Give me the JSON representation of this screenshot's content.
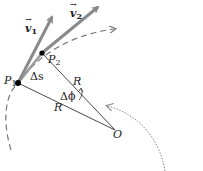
{
  "diagram": {
    "title": "",
    "labels": {
      "v1": "v",
      "v1_sub": "1",
      "v2": "v",
      "v2_sub": "2",
      "p1": "P",
      "p1_sub": "1",
      "p2": "P",
      "p2_sub": "2",
      "delta_s": "Δs",
      "r_upper": "R",
      "r_lower": "R",
      "delta_phi": "Δϕ",
      "origin": "O"
    },
    "points": {
      "P1": [
        18,
        83
      ],
      "P2": [
        42,
        53
      ],
      "O": [
        115,
        130
      ]
    },
    "vectors": {
      "v1": {
        "from": [
          18,
          83
        ],
        "to": [
          53,
          14
        ]
      },
      "v2": {
        "from": [
          42,
          53
        ],
        "to": [
          101,
          5
        ]
      }
    },
    "colors": {
      "vector": "#8a8a8a",
      "line": "#333333",
      "dashed_arc": "#777777",
      "dotted_arc": "#888888",
      "point": "#000000",
      "text": "#222222"
    }
  }
}
